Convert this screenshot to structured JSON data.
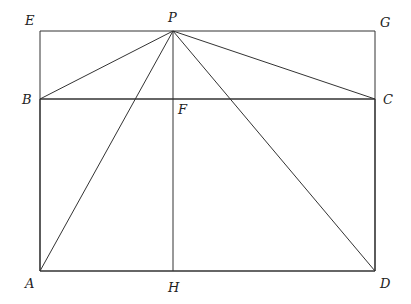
{
  "diagram": {
    "type": "geometry",
    "points": {
      "E": {
        "label": "E",
        "x": 40,
        "y": 31
      },
      "P": {
        "label": "P",
        "x": 173,
        "y": 31
      },
      "G": {
        "label": "G",
        "x": 375,
        "y": 31
      },
      "B": {
        "label": "B",
        "x": 40,
        "y": 99
      },
      "F": {
        "label": "F",
        "x": 173,
        "y": 99
      },
      "C": {
        "label": "C",
        "x": 375,
        "y": 99
      },
      "A": {
        "label": "A",
        "x": 40,
        "y": 271
      },
      "H": {
        "label": "H",
        "x": 173,
        "y": 271
      },
      "D": {
        "label": "D",
        "x": 375,
        "y": 271
      }
    },
    "segments": [
      [
        "E",
        "G"
      ],
      [
        "E",
        "B"
      ],
      [
        "G",
        "C"
      ],
      [
        "B",
        "C"
      ],
      [
        "A",
        "B"
      ],
      [
        "C",
        "D"
      ],
      [
        "A",
        "D"
      ],
      [
        "P",
        "B"
      ],
      [
        "P",
        "C"
      ],
      [
        "P",
        "A"
      ],
      [
        "P",
        "D"
      ],
      [
        "P",
        "H"
      ]
    ]
  }
}
